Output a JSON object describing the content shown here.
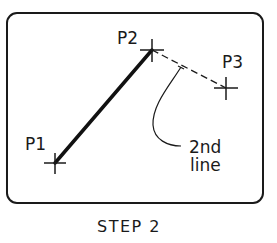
{
  "diagram": {
    "type": "cad-line-command-step",
    "caption": "STEP 2",
    "points": [
      {
        "label": "P1",
        "x": 55,
        "y": 163
      },
      {
        "label": "P2",
        "x": 152,
        "y": 50
      },
      {
        "label": "P3",
        "x": 226,
        "y": 88
      }
    ],
    "segments": [
      {
        "from": "P1",
        "to": "P2",
        "style": "solid-thick",
        "description": "1st line (drawn)"
      },
      {
        "from": "P2",
        "to": "P3",
        "style": "dashed",
        "description": "2nd line (rubber-band preview)"
      }
    ],
    "annotation": {
      "line1": "2nd",
      "line2": "line",
      "points_to": "P2-P3 segment"
    },
    "colors": {
      "stroke": "#1a1a1a",
      "background": "#ffffff"
    }
  }
}
